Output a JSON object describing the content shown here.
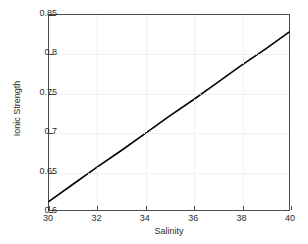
{
  "chart_data": {
    "type": "line",
    "title": "",
    "xlabel": "Salinity",
    "ylabel": "Ionic Strength",
    "xlim": [
      30,
      40
    ],
    "ylim": [
      0.6,
      0.85
    ],
    "xticks": [
      30,
      32,
      34,
      36,
      38,
      40
    ],
    "yticks": [
      0.6,
      0.65,
      0.7,
      0.75,
      0.8,
      0.85
    ],
    "xtick_labels": [
      "30",
      "32",
      "34",
      "36",
      "38",
      "40"
    ],
    "ytick_labels": [
      "0.6",
      "0.65",
      "0.7",
      "0.75",
      "0.8",
      "0.85"
    ],
    "grid": true,
    "legend": null,
    "series": [
      {
        "name": "Ionic Strength vs Salinity",
        "color": "#000000",
        "linewidth": 1.6,
        "x": [
          30,
          31,
          32,
          33,
          34,
          35,
          36,
          37,
          38,
          39,
          40
        ],
        "y": [
          0.611,
          0.633,
          0.655,
          0.676,
          0.698,
          0.72,
          0.741,
          0.763,
          0.785,
          0.806,
          0.828
        ]
      }
    ]
  },
  "axes": {
    "line_color": "#4d4d4d",
    "grid_color": "#e2e2e2",
    "background": "#ffffff"
  }
}
